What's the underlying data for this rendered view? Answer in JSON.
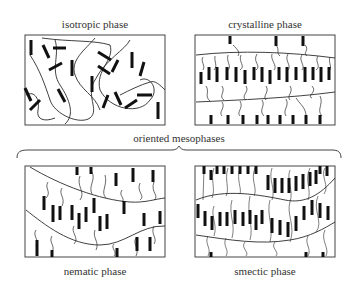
{
  "panels": {
    "isotropic": {
      "title": "isotropic phase"
    },
    "crystalline": {
      "title": "crystalline phase"
    },
    "nematic": {
      "title": "nematic phase"
    },
    "smectic": {
      "title": "smectic phase"
    }
  },
  "group_label": "oriented mesophases",
  "colors": {
    "line": "#2a2a2a",
    "mesogen": "#1a1a1a",
    "background": "#ffffff"
  }
}
